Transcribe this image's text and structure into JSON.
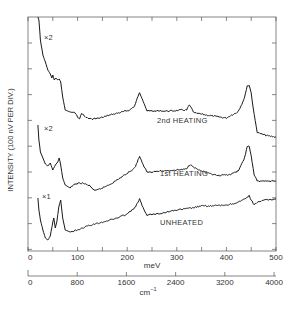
{
  "chart_data": {
    "type": "line",
    "title": "",
    "xlabel": "meV",
    "xlabel_secondary": "cm⁻¹",
    "ylabel": "INTENSITY (100 nV PER DIV.)",
    "xlim": [
      0,
      500
    ],
    "x_ticks": [
      0,
      100,
      200,
      300,
      400,
      500
    ],
    "x_minor_ticks": [
      50,
      150,
      250,
      350,
      450
    ],
    "x_secondary_ticks": [
      0,
      800,
      1600,
      2400,
      3200,
      4000
    ],
    "grid": false,
    "series": [
      {
        "name": "2nd HEATING",
        "scale": "×2",
        "points": [
          [
            20,
            -10
          ],
          [
            22,
            20
          ],
          [
            25,
            40
          ],
          [
            30,
            55
          ],
          [
            35,
            62
          ],
          [
            40,
            70
          ],
          [
            45,
            74
          ],
          [
            48,
            78
          ],
          [
            50,
            75
          ],
          [
            53,
            80
          ],
          [
            56,
            78
          ],
          [
            60,
            80
          ],
          [
            63,
            79
          ],
          [
            66,
            82
          ],
          [
            70,
            97
          ],
          [
            75,
            110
          ],
          [
            85,
            112
          ],
          [
            95,
            113
          ],
          [
            100,
            117
          ],
          [
            104,
            119
          ],
          [
            108,
            113
          ],
          [
            115,
            117
          ],
          [
            125,
            119
          ],
          [
            145,
            118
          ],
          [
            165,
            115
          ],
          [
            190,
            112
          ],
          [
            205,
            110
          ],
          [
            215,
            106
          ],
          [
            222,
            96
          ],
          [
            225,
            93
          ],
          [
            230,
            98
          ],
          [
            240,
            111
          ],
          [
            260,
            111
          ],
          [
            290,
            111
          ],
          [
            310,
            110
          ],
          [
            320,
            110
          ],
          [
            325,
            105
          ],
          [
            328,
            107
          ],
          [
            335,
            113
          ],
          [
            360,
            115
          ],
          [
            385,
            117
          ],
          [
            400,
            118
          ],
          [
            410,
            115
          ],
          [
            420,
            113
          ],
          [
            425,
            110
          ],
          [
            435,
            100
          ],
          [
            442,
            86
          ],
          [
            446,
            85
          ],
          [
            450,
            93
          ],
          [
            456,
            115
          ],
          [
            462,
            132
          ],
          [
            470,
            134
          ],
          [
            485,
            136
          ],
          [
            500,
            137
          ]
        ]
      },
      {
        "name": "1st HEATING",
        "scale": "×2",
        "points": [
          [
            20,
            125
          ],
          [
            22,
            140
          ],
          [
            25,
            152
          ],
          [
            30,
            158
          ],
          [
            35,
            164
          ],
          [
            40,
            166
          ],
          [
            45,
            163
          ],
          [
            50,
            170
          ],
          [
            55,
            165
          ],
          [
            60,
            162
          ],
          [
            63,
            158
          ],
          [
            66,
            165
          ],
          [
            70,
            178
          ],
          [
            75,
            185
          ],
          [
            85,
            188
          ],
          [
            95,
            184
          ],
          [
            110,
            183
          ],
          [
            125,
            186
          ],
          [
            135,
            191
          ],
          [
            150,
            188
          ],
          [
            170,
            183
          ],
          [
            195,
            175
          ],
          [
            215,
            168
          ],
          [
            222,
            160
          ],
          [
            225,
            156
          ],
          [
            230,
            163
          ],
          [
            240,
            172
          ],
          [
            270,
            171
          ],
          [
            300,
            170
          ],
          [
            320,
            169
          ],
          [
            325,
            165
          ],
          [
            330,
            165
          ],
          [
            340,
            169
          ],
          [
            360,
            173
          ],
          [
            385,
            176
          ],
          [
            410,
            174
          ],
          [
            420,
            172
          ],
          [
            425,
            170
          ],
          [
            435,
            160
          ],
          [
            442,
            147
          ],
          [
            446,
            146
          ],
          [
            450,
            156
          ],
          [
            456,
            175
          ],
          [
            462,
            181
          ],
          [
            480,
            181
          ],
          [
            500,
            181
          ]
        ]
      },
      {
        "name": "UNHEATED",
        "scale": "×1",
        "points": [
          [
            20,
            198
          ],
          [
            22,
            210
          ],
          [
            25,
            220
          ],
          [
            30,
            230
          ],
          [
            35,
            238
          ],
          [
            40,
            240
          ],
          [
            45,
            236
          ],
          [
            50,
            222
          ],
          [
            52,
            218
          ],
          [
            55,
            228
          ],
          [
            58,
            222
          ],
          [
            62,
            207
          ],
          [
            66,
            200
          ],
          [
            70,
            218
          ],
          [
            75,
            230
          ],
          [
            85,
            232
          ],
          [
            100,
            230
          ],
          [
            110,
            228
          ],
          [
            120,
            226
          ],
          [
            150,
            222
          ],
          [
            180,
            218
          ],
          [
            200,
            214
          ],
          [
            215,
            208
          ],
          [
            222,
            202
          ],
          [
            225,
            199
          ],
          [
            230,
            206
          ],
          [
            240,
            215
          ],
          [
            270,
            213
          ],
          [
            300,
            210
          ],
          [
            330,
            208
          ],
          [
            350,
            206
          ],
          [
            370,
            206
          ],
          [
            400,
            205
          ],
          [
            420,
            203
          ],
          [
            430,
            201
          ],
          [
            440,
            198
          ],
          [
            446,
            196
          ],
          [
            450,
            200
          ],
          [
            456,
            205
          ],
          [
            462,
            202
          ],
          [
            480,
            200
          ],
          [
            500,
            199
          ]
        ]
      }
    ],
    "annotations": [
      {
        "text": "×2",
        "near": "2nd HEATING start"
      },
      {
        "text": "×2",
        "near": "1st HEATING start"
      },
      {
        "text": "×1",
        "near": "UNHEATED start"
      },
      {
        "text": "2nd HEATING",
        "position": "label under curve ~270 meV"
      },
      {
        "text": "1st HEATING",
        "position": "label under curve ~270 meV"
      },
      {
        "text": "UNHEATED",
        "position": "label under curve ~260 meV"
      }
    ]
  },
  "labels": {
    "ylabel": "INTENSITY (100 nV PER DIV.)",
    "xlabel_mev": "meV",
    "xlabel_cm": "cm",
    "xlabel_cm_sup": "−1",
    "curve_2nd": "2nd HEATING",
    "curve_1st": "1st HEATING",
    "curve_unheated": "UNHEATED",
    "scale_2nd": "×2",
    "scale_1st": "×2",
    "scale_unheated": "×1",
    "mev_ticks": [
      "0",
      "100",
      "200",
      "300",
      "400",
      "500"
    ],
    "cm_ticks": [
      "0",
      "800",
      "1600",
      "2400",
      "3200",
      "4000"
    ]
  },
  "colors": {
    "line": "#1a1a1a",
    "axis": "#555555",
    "background": "#ffffff"
  }
}
